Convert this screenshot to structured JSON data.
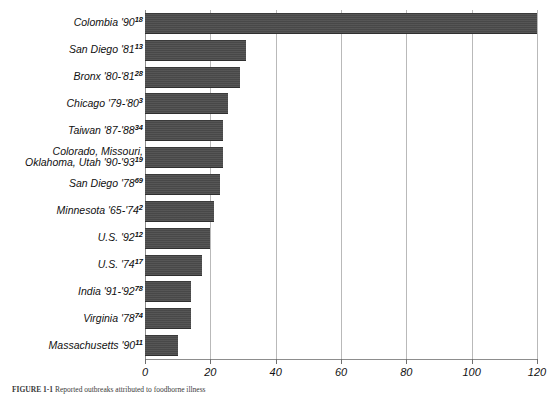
{
  "figure": {
    "caption_label": "FIGURE 1-1",
    "caption_text": "Reported outbreaks attributed to foodborne illness"
  },
  "chart_data": {
    "type": "bar",
    "orientation": "horizontal",
    "title": "",
    "xlabel": "",
    "ylabel": "",
    "xlim": [
      0,
      120
    ],
    "xticks": [
      0,
      20,
      40,
      60,
      80,
      100,
      120
    ],
    "xtick_labels": [
      "0",
      "20",
      "40",
      "60",
      "80",
      "100",
      "120"
    ],
    "grid": true,
    "grid_axis": "x",
    "legend": null,
    "bar_color": "#4c4c4c",
    "categories": [
      "Colombia '90",
      "San Diego '81",
      "Bronx '80-'81",
      "Chicago '79-'80",
      "Taiwan '87-'88",
      "Colorado, Missouri, Oklahoma, Utah '90-'93",
      "San Diego '78",
      "Minnesota '65-'74",
      "U.S. '92",
      "U.S. '74",
      "India '91-'92",
      "Virginia '78",
      "Massachusetts '90"
    ],
    "footnote_markers": [
      "18",
      "13",
      "28",
      "3",
      "34",
      "19",
      "69",
      "2",
      "12",
      "17",
      "78",
      "74",
      "11"
    ],
    "values": [
      120,
      31,
      29,
      25.5,
      24,
      24,
      23,
      21,
      20,
      17.5,
      14,
      14,
      10
    ]
  },
  "rows": [
    {
      "label": "Colombia '90",
      "sup": "18",
      "value": 120,
      "lines": [
        "Colombia '90"
      ]
    },
    {
      "label": "San Diego '81",
      "sup": "13",
      "value": 31,
      "lines": [
        "San Diego '81"
      ]
    },
    {
      "label": "Bronx '80-'81",
      "sup": "28",
      "value": 29,
      "lines": [
        "Bronx '80-'81"
      ]
    },
    {
      "label": "Chicago '79-'80",
      "sup": "3",
      "value": 25.5,
      "lines": [
        "Chicago '79-'80"
      ]
    },
    {
      "label": "Taiwan '87-'88",
      "sup": "34",
      "value": 24,
      "lines": [
        "Taiwan '87-'88"
      ]
    },
    {
      "label": "Colorado, Missouri, Oklahoma, Utah '90-'93",
      "sup": "19",
      "value": 24,
      "lines": [
        "Colorado, Missouri,",
        "Oklahoma, Utah '90-'93"
      ]
    },
    {
      "label": "San Diego '78",
      "sup": "69",
      "value": 23,
      "lines": [
        "San Diego '78"
      ]
    },
    {
      "label": "Minnesota '65-'74",
      "sup": "2",
      "value": 21,
      "lines": [
        "Minnesota '65-'74"
      ]
    },
    {
      "label": "U.S. '92",
      "sup": "12",
      "value": 20,
      "lines": [
        "U.S. '92"
      ]
    },
    {
      "label": "U.S. '74",
      "sup": "17",
      "value": 17.5,
      "lines": [
        "U.S. '74"
      ]
    },
    {
      "label": "India '91-'92",
      "sup": "78",
      "value": 14,
      "lines": [
        "India '91-'92"
      ]
    },
    {
      "label": "Virginia '78",
      "sup": "74",
      "value": 14,
      "lines": [
        "Virginia '78"
      ]
    },
    {
      "label": "Massachusetts '90",
      "sup": "11",
      "value": 10,
      "lines": [
        "Massachusetts '90"
      ]
    }
  ]
}
